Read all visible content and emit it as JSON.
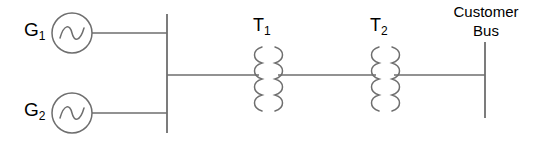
{
  "diagram": {
    "colors": {
      "line": "#6e6e6e",
      "text": "#2b2b2b",
      "background": "#ffffff"
    },
    "generators": [
      {
        "id": "g1",
        "label": "G",
        "subscript": "1",
        "symbol": "ac-source-sine"
      },
      {
        "id": "g2",
        "label": "G",
        "subscript": "2",
        "symbol": "ac-source-sine"
      }
    ],
    "transformers": [
      {
        "id": "t1",
        "label": "T",
        "subscript": "1",
        "symbol": "two-winding-transformer"
      },
      {
        "id": "t2",
        "label": "T",
        "subscript": "2",
        "symbol": "two-winding-transformer"
      }
    ],
    "buses": [
      {
        "id": "generation-bus",
        "label": ""
      },
      {
        "id": "customer-bus",
        "label_line1": "Customer",
        "label_line2": "Bus"
      }
    ]
  }
}
